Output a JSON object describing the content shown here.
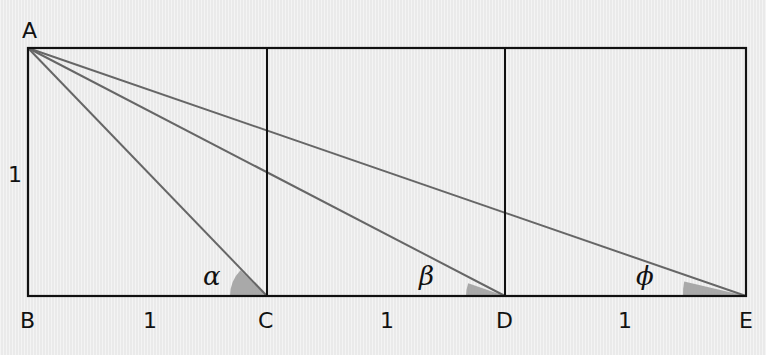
{
  "diagram": {
    "colors": {
      "background": "#eeeeee",
      "box_line": "#111111",
      "diagonal_line": "#666666",
      "angle_fill": "#a9a9a9"
    },
    "points": {
      "A": "A",
      "B": "B",
      "C": "C",
      "D": "D",
      "E": "E"
    },
    "side_labels": {
      "AB": "1",
      "BC": "1",
      "CD": "1",
      "DE": "1"
    },
    "angles": {
      "at_C": "α",
      "at_D": "β",
      "at_E": "ϕ"
    },
    "segments": [
      "AC",
      "AD",
      "AE"
    ],
    "squares": 3
  }
}
